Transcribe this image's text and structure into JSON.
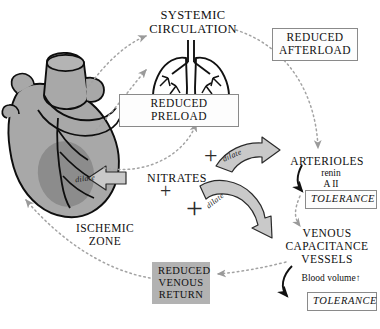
{
  "figure": {
    "background": "#ffffff",
    "accent_gray": "#b2b2b2",
    "organ_gray": "#a8a8a8",
    "ischemic_gray": "#8e8e8e"
  },
  "nodes": {
    "systemic_circulation": "SYSTEMIC\nCIRCULATION",
    "systemic_circulation_line1": "SYSTEMIC",
    "systemic_circulation_line2": "CIRCULATION",
    "reduced_afterload_line1": "REDUCED",
    "reduced_afterload_line2": "AFTERLOAD",
    "reduced_preload": "REDUCED PRELOAD",
    "nitrates": "NITRATES",
    "arterioles": "ARTERIOLES",
    "renin": "renin",
    "angiotensin_ii": "A II",
    "tolerance_arterioles": "TOLERANCE",
    "ischemic_zone_line1": "ISCHEMIC",
    "ischemic_zone_line2": "ZONE",
    "venous_line1": "VENOUS",
    "venous_line2": "CAPACITANCE",
    "venous_line3": "VESSELS",
    "blood_volume": "Blood volume",
    "blood_volume_arrow": "↑",
    "tolerance_venous": "TOLERANCE",
    "reduced_venous_return_line1": "REDUCED",
    "reduced_venous_return_line2": "VENOUS",
    "reduced_venous_return_line3": "RETURN"
  },
  "arrows": {
    "dilate_heart": "dilate",
    "dilate_arterioles": "dilate",
    "dilate_venous": "dilate",
    "plus_arterioles": "+",
    "plus_heart": "+",
    "plus_venous": "+"
  },
  "icons": {
    "heart": "heart-icon",
    "lungs": "lungs-icon"
  }
}
